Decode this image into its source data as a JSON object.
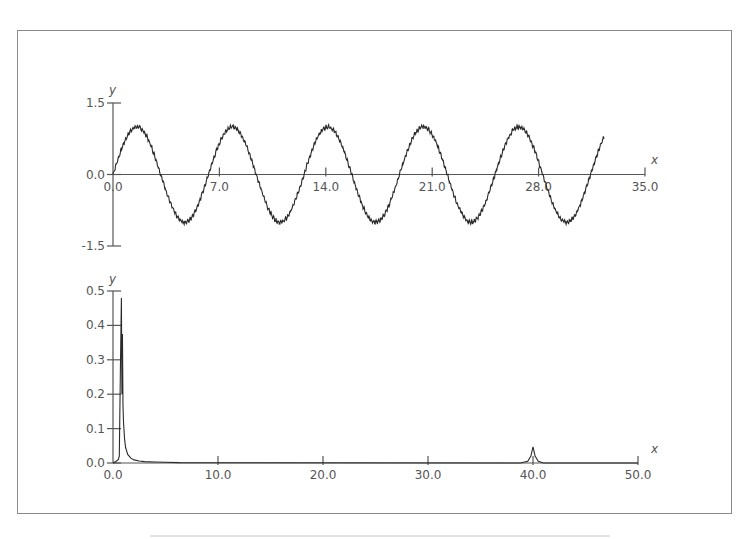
{
  "chart_data": [
    {
      "type": "line",
      "title": "",
      "xlabel": "x",
      "ylabel": "y",
      "xlim": [
        0,
        35
      ],
      "ylim": [
        -1.5,
        1.5
      ],
      "x_ticks": [
        "0.0",
        "7.0",
        "14.0",
        "21.0",
        "28.0",
        "35.0"
      ],
      "y_ticks": [
        "1.5",
        "0.0",
        "-1.5"
      ],
      "grid": false,
      "legend": null,
      "series": [
        {
          "name": "signal",
          "description": "sin(x) with small high-frequency noise, amplitude ~1.0, period ~6.28",
          "x_start": 0,
          "x_end": 32.3,
          "amplitude": 1.0,
          "period": 6.283,
          "noise_amplitude": 0.05,
          "peaks_x": [
            1.57,
            7.85,
            14.14,
            20.42,
            26.7
          ],
          "troughs_x": [
            4.71,
            10.99,
            17.28,
            23.56,
            29.85
          ]
        }
      ]
    },
    {
      "type": "line",
      "title": "",
      "xlabel": "x",
      "ylabel": "y",
      "xlim": [
        0,
        50
      ],
      "ylim": [
        0,
        0.5
      ],
      "x_ticks": [
        "0.0",
        "10.0",
        "20.0",
        "30.0",
        "40.0",
        "50.0"
      ],
      "y_ticks": [
        "0.0",
        "0.1",
        "0.2",
        "0.3",
        "0.4",
        "0.5"
      ],
      "grid": false,
      "legend": null,
      "series": [
        {
          "name": "spectrum",
          "x": [
            0.0,
            0.3,
            0.5,
            0.6,
            0.7,
            0.8,
            0.85,
            0.9,
            0.95,
            1.0,
            1.1,
            1.2,
            1.4,
            1.7,
            2.0,
            2.5,
            3.0,
            4.0,
            5.0,
            6.3,
            38.8,
            39.5,
            39.8,
            40.0,
            40.2,
            40.5,
            41.0,
            50.0
          ],
          "y": [
            0.0,
            0.005,
            0.01,
            0.02,
            0.26,
            0.48,
            0.2,
            0.375,
            0.17,
            0.12,
            0.07,
            0.045,
            0.025,
            0.014,
            0.009,
            0.006,
            0.004,
            0.003,
            0.002,
            0.001,
            0.0,
            0.005,
            0.02,
            0.047,
            0.02,
            0.005,
            0.0,
            0.0
          ]
        }
      ]
    }
  ],
  "labels": {
    "upper_y_letter": "y",
    "upper_x_letter": "x",
    "lower_y_letter": "y",
    "lower_x_letter": "x"
  },
  "colors": {
    "line": "#2a2a2a",
    "axis": "#555555",
    "frame": "#8a8a8a"
  }
}
